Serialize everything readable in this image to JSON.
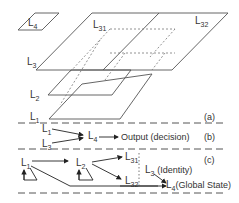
{
  "diagram": {
    "part_a": {
      "tag": "(a)",
      "layers": [
        {
          "id": "L4",
          "base": "L",
          "sub": "4"
        },
        {
          "id": "L3",
          "base": "L",
          "sub": "3"
        },
        {
          "id": "L31",
          "base": "L",
          "sub": "31"
        },
        {
          "id": "L32",
          "base": "L",
          "sub": "32"
        },
        {
          "id": "L2",
          "base": "L",
          "sub": "2"
        },
        {
          "id": "L1",
          "base": "L",
          "sub": "1"
        }
      ]
    },
    "part_b": {
      "tag": "(b)",
      "inputs": [
        {
          "base": "L",
          "sub": "1"
        },
        {
          "base": "L",
          "sub": "3"
        }
      ],
      "target": {
        "base": "L",
        "sub": "4"
      },
      "output_label": "Output (decision)"
    },
    "part_c": {
      "tag": "(c)",
      "nodes": [
        {
          "id": "L1",
          "base": "L",
          "sub": "1"
        },
        {
          "id": "L2",
          "base": "L",
          "sub": "2"
        },
        {
          "id": "L31",
          "base": "L",
          "sub": "31"
        },
        {
          "id": "L32",
          "base": "L",
          "sub": "32"
        },
        {
          "id": "L3",
          "base": "L",
          "sub": "3",
          "note": "(Identity)"
        },
        {
          "id": "L4",
          "base": "L",
          "sub": "4",
          "note": "(Global State)"
        }
      ]
    }
  }
}
